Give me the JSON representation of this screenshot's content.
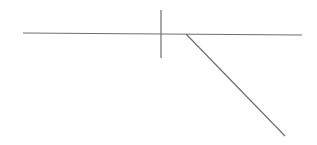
{
  "diagram": {
    "background": "#ffffff",
    "stroke_color": "#6f6f6f",
    "stroke_width": 1.2,
    "lines": [
      {
        "name": "horizontal-line",
        "x1": 23,
        "y1": 33,
        "x2": 302,
        "y2": 35
      },
      {
        "name": "vertical-tick",
        "x1": 161,
        "y1": 10,
        "x2": 161,
        "y2": 58
      },
      {
        "name": "diagonal-line",
        "x1": 186,
        "y1": 34,
        "x2": 285,
        "y2": 136
      }
    ]
  }
}
